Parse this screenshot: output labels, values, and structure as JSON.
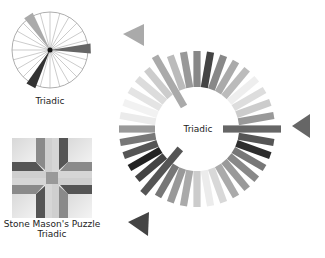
{
  "small_wheel": {
    "caption": "Triadic",
    "spokes": 24,
    "highlight_arms": [
      {
        "angle_deg": 0,
        "color": "#666666",
        "length": 40
      },
      {
        "angle_deg": 120,
        "color": "#333333",
        "length": 40
      },
      {
        "angle_deg": 240,
        "color": "#aaaaaa",
        "length": 40
      }
    ]
  },
  "puzzle_block": {
    "name": "Stone Mason's Puzzle",
    "scheme": "Triadic"
  },
  "main_ring": {
    "center_label": "Triadic",
    "bar_count": 36,
    "long_bar_indices": [
      0,
      13,
      24
    ],
    "bar_colors": [
      "#666666",
      "#555555",
      "#2e2e2e",
      "#777777",
      "#888888",
      "#999999",
      "#aaaaaa",
      "#d8d8d8",
      "#ececec",
      "#cccccc",
      "#aaaaaa",
      "#999999",
      "#777777",
      "#555555",
      "#444444",
      "#222222",
      "#555555",
      "#777777",
      "#999999",
      "#ebebeb",
      "#f2f2f2",
      "#e4e4e4",
      "#dcdcdc",
      "#cccccc",
      "#aaaaaa",
      "#bbbbbb",
      "#999999",
      "#888888",
      "#444444",
      "#888888",
      "#aaaaaa",
      "#bbbbbb",
      "#eeeeee",
      "#dddddd",
      "#cccccc",
      "#999999"
    ],
    "pointers": [
      {
        "name": "pointer-right",
        "color": "#666666"
      },
      {
        "name": "pointer-bottom-left",
        "color": "#444444"
      },
      {
        "name": "pointer-top-left",
        "color": "#aaaaaa"
      }
    ]
  }
}
